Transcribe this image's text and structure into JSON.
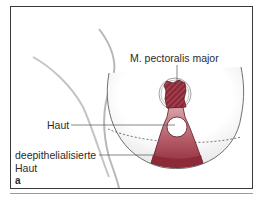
{
  "figure": {
    "panel_letter": "a",
    "labels": {
      "muscle": "M. pectoralis major",
      "skin": "Haut",
      "deepithelialized_line1": "deepithelialisierte",
      "deepithelialized_line2": "Haut"
    },
    "colors": {
      "tissue": "#8e2a38",
      "tissue_light": "#c98a92",
      "outline": "#3a3a3a",
      "leader_line": "#555555"
    }
  }
}
